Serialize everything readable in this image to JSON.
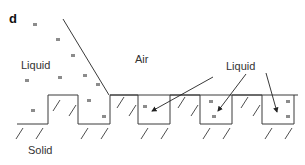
{
  "panel": {
    "letter": "d"
  },
  "labels": {
    "liquid_left": "Liquid",
    "air": "Air",
    "liquid_right": "Liquid",
    "solid": "Solid"
  },
  "colors": {
    "line": "#3a3a3a",
    "particle": "#8c8c8c",
    "text": "#333333",
    "background": "#ffffff"
  },
  "diagram": {
    "regions": [
      "Liquid",
      "Air",
      "Solid"
    ],
    "grooves_with_arrows": 3
  }
}
